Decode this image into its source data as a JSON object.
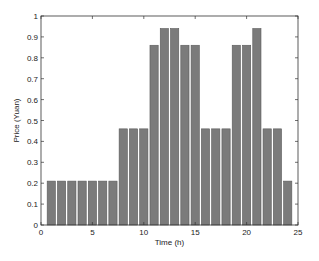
{
  "chart_data": {
    "type": "bar",
    "title": "",
    "xlabel": "Time (h)",
    "ylabel": "Price (Yuan)",
    "xlim": [
      0,
      25
    ],
    "ylim": [
      0,
      1
    ],
    "xticks": [
      0,
      5,
      10,
      15,
      20,
      25
    ],
    "yticks": [
      0,
      0.1,
      0.2,
      0.3,
      0.4,
      0.5,
      0.6,
      0.7,
      0.8,
      0.9,
      1
    ],
    "ytick_labels": [
      "0",
      "0.1",
      "0.2",
      "0.3",
      "0.4",
      "0.5",
      "0.6",
      "0.7",
      "0.8",
      "0.9",
      "1"
    ],
    "grid": false,
    "legend": null,
    "bar_color": "#7b7b7b",
    "categories": [
      1,
      2,
      3,
      4,
      5,
      6,
      7,
      8,
      9,
      10,
      11,
      12,
      13,
      14,
      15,
      16,
      17,
      18,
      19,
      20,
      21,
      22,
      23,
      24
    ],
    "values": [
      0.21,
      0.21,
      0.21,
      0.21,
      0.21,
      0.21,
      0.21,
      0.46,
      0.46,
      0.46,
      0.86,
      0.94,
      0.94,
      0.86,
      0.86,
      0.46,
      0.46,
      0.46,
      0.86,
      0.86,
      0.94,
      0.46,
      0.46,
      0.21
    ]
  }
}
